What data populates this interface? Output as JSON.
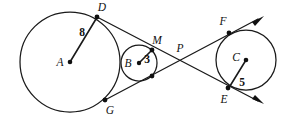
{
  "figure": {
    "stroke_color": "#1a1a1a",
    "label_color": "#111111",
    "background": "#ffffff",
    "width": 292,
    "height": 121
  },
  "circles": [
    {
      "id": "circle-a",
      "center_label": "A",
      "radius_label": "8",
      "cx": 70,
      "cy": 62,
      "r": 50,
      "center_label_x": 60,
      "center_label_y": 63,
      "radius_label_x": 82,
      "radius_label_y": 33
    },
    {
      "id": "circle-b",
      "center_label": "B",
      "radius_label": "3",
      "cx": 139,
      "cy": 63,
      "r": 18,
      "center_label_x": 128,
      "center_label_y": 64,
      "radius_label_x": 147,
      "radius_label_y": 60
    },
    {
      "id": "circle-c",
      "center_label": "C",
      "radius_label": "5",
      "cx": 246,
      "cy": 60,
      "r": 30,
      "center_label_x": 236,
      "center_label_y": 58,
      "radius_label_x": 242,
      "radius_label_y": 83
    }
  ],
  "points": [
    {
      "id": "point-d",
      "label": "D",
      "x": 97,
      "y": 17,
      "label_x": 102,
      "label_y": 8
    },
    {
      "id": "point-m",
      "label": "M",
      "x": 152,
      "y": 50,
      "label_x": 157,
      "label_y": 41
    },
    {
      "id": "point-p",
      "label": "P",
      "x": 180,
      "y": 58,
      "label_x": 180,
      "label_y": 49
    },
    {
      "id": "point-f",
      "label": "F",
      "x": 229,
      "y": 33,
      "label_x": 223,
      "label_y": 22
    },
    {
      "id": "point-g",
      "label": "G",
      "x": 105,
      "y": 100,
      "label_x": 110,
      "label_y": 111
    },
    {
      "id": "point-e",
      "label": "E",
      "x": 228,
      "y": 88,
      "label_x": 224,
      "label_y": 100
    },
    {
      "id": "point-b-lower-tangency",
      "label": "",
      "x": 152,
      "y": 76,
      "label_x": 0,
      "label_y": 0
    }
  ],
  "radii": [
    {
      "id": "radius-a-to-d",
      "x1": 70,
      "y1": 62,
      "x2": 97,
      "y2": 18,
      "label": "8"
    },
    {
      "id": "radius-b-to-m",
      "x1": 139,
      "y1": 63,
      "x2": 152,
      "y2": 51,
      "label": "3"
    },
    {
      "id": "radius-c-to-e",
      "x1": 246,
      "y1": 60,
      "x2": 229,
      "y2": 87,
      "label": "5"
    }
  ],
  "tangent_lines": [
    {
      "id": "tangent-upper-d-to-e",
      "description": "upper external tangent through D, M, P to E and beyond",
      "x1": 97,
      "y1": 17,
      "x2": 262,
      "y2": 103,
      "arrow_at_end": true
    },
    {
      "id": "tangent-lower-g-to-f",
      "description": "lower tangent through G, tangency of B, P to F and beyond",
      "x1": 105,
      "y1": 100,
      "x2": 262,
      "y2": 17,
      "arrow_at_end": true
    }
  ],
  "arrowheads": [
    {
      "id": "arrowhead-upper-right",
      "tip_x": 263,
      "tip_y": 16,
      "angle_deg": -28
    },
    {
      "id": "arrowhead-lower-right",
      "tip_x": 263,
      "tip_y": 104,
      "angle_deg": 28
    }
  ]
}
